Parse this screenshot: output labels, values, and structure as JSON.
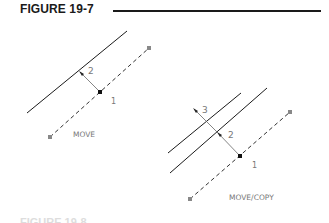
{
  "figure": {
    "title": "FIGURE 19-7",
    "footer_partial": "FIGURE 19-8"
  },
  "move_diagram": {
    "caption": "MOVE",
    "point_label_1": "1",
    "offset_label_2": "2"
  },
  "move_copy_diagram": {
    "caption": "MOVE/COPY",
    "point_label_1": "1",
    "offset_label_2": "2",
    "offset_label_3": "3"
  },
  "colors": {
    "line": "#1a1a1a",
    "label": "#777777",
    "dashed": "#333333",
    "endpoint": "#888888"
  }
}
